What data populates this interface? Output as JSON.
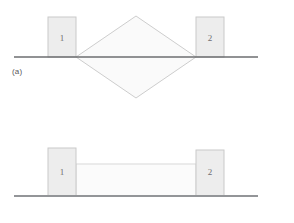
{
  "figure": {
    "background_color": "#ffffff",
    "panels": [
      {
        "id": "a",
        "label": "(a)",
        "ground_line": {
          "name": "ground-line",
          "x1": 14,
          "y1": 57,
          "x2": 258,
          "y2": 57,
          "color": "#6d6e71",
          "width": 1.6
        },
        "blocks": [
          {
            "name": "block-1",
            "number": "1",
            "x": 48,
            "y": 17,
            "w": 28,
            "h": 40,
            "fill": "#ededed",
            "stroke": "#c9c9c9",
            "label_x": 62,
            "label_y": 41
          },
          {
            "name": "block-2",
            "number": "2",
            "x": 196,
            "y": 17,
            "w": 28,
            "h": 40,
            "fill": "#ededed",
            "stroke": "#c9c9c9",
            "label_x": 210,
            "label_y": 41
          }
        ],
        "shape": {
          "name": "diamond-spring",
          "kind": "diamond",
          "points": "76,57 136,16 196,57 136,98",
          "fill": "#fafafa",
          "stroke": "#c7c7c7",
          "stroke_width": 0.9
        }
      },
      {
        "id": "b",
        "label": "(b)",
        "ground_line": {
          "name": "ground-line",
          "x1": 14,
          "y1": 196,
          "x2": 258,
          "y2": 196,
          "color": "#939598",
          "width": 1.8
        },
        "blocks": [
          {
            "name": "block-1",
            "number": "1",
            "x": 48,
            "y": 148,
            "w": 28,
            "h": 48,
            "fill": "#ededed",
            "stroke": "#c9c9c9",
            "label_x": 62,
            "label_y": 175
          },
          {
            "name": "block-2",
            "number": "2",
            "x": 196,
            "y": 150,
            "w": 28,
            "h": 46,
            "fill": "#ededed",
            "stroke": "#c9c9c9",
            "label_x": 210,
            "label_y": 175
          }
        ],
        "shape": {
          "name": "rectangle-spring",
          "kind": "rect",
          "x": 76,
          "y": 164,
          "w": 120,
          "h": 32,
          "fill": "#fbfbfb",
          "stroke": "#d4d4d4",
          "stroke_width": 0.9
        }
      }
    ]
  },
  "colors": {
    "block_fill": "#ededed",
    "block_stroke": "#c9c9c9",
    "shape_fill": "#fafafa",
    "shape_stroke": "#c7c7c7",
    "ground_dark": "#6d6e71",
    "ground_light": "#939598",
    "text": "#58595b",
    "number_text": "#6d6e71"
  }
}
